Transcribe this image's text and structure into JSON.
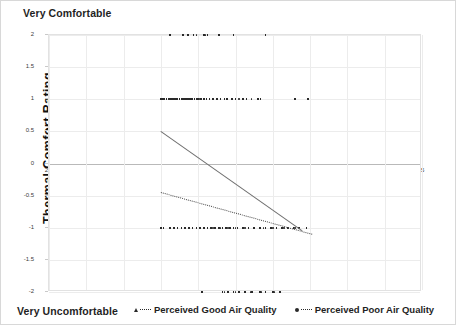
{
  "chart_data": {
    "type": "scatter",
    "title": "",
    "xlabel": "Ta",
    "ylabel": "Thermal Comfort Rating",
    "xlim": [
      25,
      45
    ],
    "ylim": [
      -2,
      2
    ],
    "xticks": [
      25,
      27,
      29,
      31,
      33,
      35,
      37,
      39,
      41,
      43,
      45
    ],
    "yticks": [
      2,
      1.5,
      1,
      0.5,
      0,
      -0.5,
      -1,
      -1.5,
      -2
    ],
    "grid": true,
    "legend_position": "bottom",
    "scale_top_label": "Very Comfortable",
    "scale_bottom_label": "Very Uncomfortable",
    "series": [
      {
        "name": "Perceived Good Air Quality",
        "marker": "triangle",
        "line_style": "solid",
        "color": "#2a2a2a",
        "trendline": {
          "x0": 31.0,
          "y0": 0.5,
          "x1": 38.6,
          "y1": -1.05
        },
        "points": [
          {
            "x": 31.5,
            "y": 2
          },
          {
            "x": 32.2,
            "y": 2
          },
          {
            "x": 32.45,
            "y": 2
          },
          {
            "x": 32.75,
            "y": 2
          },
          {
            "x": 33.3,
            "y": 2
          },
          {
            "x": 33.5,
            "y": 2
          },
          {
            "x": 34.1,
            "y": 2
          },
          {
            "x": 34.9,
            "y": 2
          },
          {
            "x": 36.6,
            "y": 2
          },
          {
            "x": 31.0,
            "y": 1
          },
          {
            "x": 31.1,
            "y": 1
          },
          {
            "x": 31.2,
            "y": 1
          },
          {
            "x": 31.3,
            "y": 1
          },
          {
            "x": 31.4,
            "y": 1
          },
          {
            "x": 31.5,
            "y": 1
          },
          {
            "x": 31.6,
            "y": 1
          },
          {
            "x": 31.7,
            "y": 1
          },
          {
            "x": 31.8,
            "y": 1
          },
          {
            "x": 31.9,
            "y": 1
          },
          {
            "x": 32.0,
            "y": 1
          },
          {
            "x": 32.1,
            "y": 1
          },
          {
            "x": 32.2,
            "y": 1
          },
          {
            "x": 32.3,
            "y": 1
          },
          {
            "x": 32.4,
            "y": 1
          },
          {
            "x": 32.5,
            "y": 1
          },
          {
            "x": 32.6,
            "y": 1
          },
          {
            "x": 32.7,
            "y": 1
          },
          {
            "x": 32.8,
            "y": 1
          },
          {
            "x": 32.9,
            "y": 1
          },
          {
            "x": 33.0,
            "y": 1
          },
          {
            "x": 33.15,
            "y": 1
          },
          {
            "x": 33.3,
            "y": 1
          },
          {
            "x": 33.45,
            "y": 1
          },
          {
            "x": 33.6,
            "y": 1
          },
          {
            "x": 33.8,
            "y": 1
          },
          {
            "x": 34.0,
            "y": 1
          },
          {
            "x": 34.2,
            "y": 1
          },
          {
            "x": 34.4,
            "y": 1
          },
          {
            "x": 34.55,
            "y": 1
          },
          {
            "x": 34.8,
            "y": 1
          },
          {
            "x": 35.0,
            "y": 1
          },
          {
            "x": 35.4,
            "y": 1
          },
          {
            "x": 35.6,
            "y": 1
          },
          {
            "x": 36.2,
            "y": 1
          },
          {
            "x": 36.35,
            "y": 1
          },
          {
            "x": 38.2,
            "y": 1
          },
          {
            "x": 38.9,
            "y": 1
          },
          {
            "x": 31.0,
            "y": -1
          },
          {
            "x": 31.15,
            "y": -1
          },
          {
            "x": 31.5,
            "y": -1
          },
          {
            "x": 31.7,
            "y": -1
          },
          {
            "x": 31.9,
            "y": -1
          },
          {
            "x": 32.1,
            "y": -1
          },
          {
            "x": 32.3,
            "y": -1
          },
          {
            "x": 32.5,
            "y": -1
          },
          {
            "x": 32.7,
            "y": -1
          },
          {
            "x": 32.9,
            "y": -1
          },
          {
            "x": 33.1,
            "y": -1
          },
          {
            "x": 33.3,
            "y": -1
          },
          {
            "x": 33.5,
            "y": -1
          },
          {
            "x": 33.7,
            "y": -1
          },
          {
            "x": 33.9,
            "y": -1
          },
          {
            "x": 34.1,
            "y": -1
          },
          {
            "x": 34.3,
            "y": -1
          },
          {
            "x": 34.5,
            "y": -1
          },
          {
            "x": 34.7,
            "y": -1
          },
          {
            "x": 34.9,
            "y": -1
          },
          {
            "x": 35.1,
            "y": -1
          },
          {
            "x": 35.4,
            "y": -1
          },
          {
            "x": 35.7,
            "y": -1
          },
          {
            "x": 36.0,
            "y": -1
          },
          {
            "x": 36.3,
            "y": -1
          },
          {
            "x": 36.6,
            "y": -1
          },
          {
            "x": 36.9,
            "y": -1
          },
          {
            "x": 37.2,
            "y": -1
          },
          {
            "x": 37.5,
            "y": -1
          },
          {
            "x": 37.8,
            "y": -1
          },
          {
            "x": 38.1,
            "y": -1
          },
          {
            "x": 38.4,
            "y": -1
          },
          {
            "x": 38.8,
            "y": -1
          },
          {
            "x": 33.2,
            "y": -2
          },
          {
            "x": 34.3,
            "y": -2
          },
          {
            "x": 34.6,
            "y": -2
          },
          {
            "x": 34.9,
            "y": -2
          },
          {
            "x": 35.2,
            "y": -2
          },
          {
            "x": 35.5,
            "y": -2
          },
          {
            "x": 35.9,
            "y": -2
          },
          {
            "x": 36.3,
            "y": -2
          },
          {
            "x": 36.6,
            "y": -2
          },
          {
            "x": 37.0,
            "y": -2
          },
          {
            "x": 37.4,
            "y": -2
          }
        ]
      },
      {
        "name": "Perceived Poor Air Quality",
        "marker": "circle",
        "line_style": "dotted",
        "color": "#2a2a2a",
        "trendline": {
          "x0": 31.0,
          "y0": -0.45,
          "x1": 39.1,
          "y1": -1.1
        },
        "points": [
          {
            "x": 32.9,
            "y": 2
          },
          {
            "x": 33.4,
            "y": 2
          },
          {
            "x": 32.35,
            "y": 1
          },
          {
            "x": 32.6,
            "y": 1
          },
          {
            "x": 33.05,
            "y": 1
          },
          {
            "x": 35.2,
            "y": 1
          },
          {
            "x": 35.85,
            "y": 1
          },
          {
            "x": 33.8,
            "y": -1
          },
          {
            "x": 34.2,
            "y": -1
          },
          {
            "x": 34.6,
            "y": -1
          },
          {
            "x": 35.0,
            "y": -1
          },
          {
            "x": 35.5,
            "y": -1
          },
          {
            "x": 36.0,
            "y": -1
          },
          {
            "x": 36.5,
            "y": -1
          },
          {
            "x": 37.0,
            "y": -1
          },
          {
            "x": 37.6,
            "y": -1
          },
          {
            "x": 38.2,
            "y": -1
          },
          {
            "x": 34.4,
            "y": -2
          },
          {
            "x": 35.0,
            "y": -2
          },
          {
            "x": 35.8,
            "y": -2
          },
          {
            "x": 36.4,
            "y": -2
          },
          {
            "x": 37.1,
            "y": -2
          }
        ]
      }
    ]
  },
  "legend": {
    "items": [
      {
        "label": "Perceived Good Air Quality"
      },
      {
        "label": "Perceived Poor Air Quality"
      }
    ]
  }
}
